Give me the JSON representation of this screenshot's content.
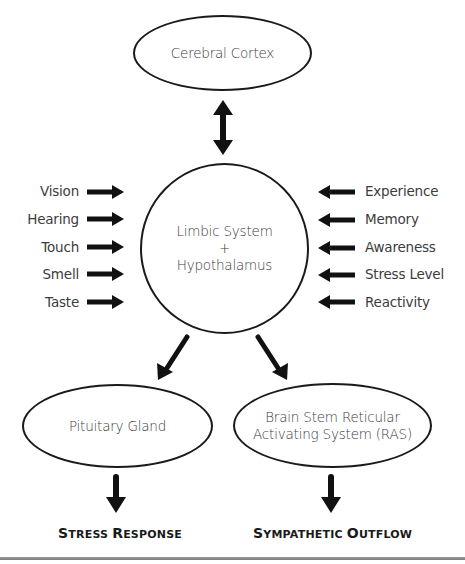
{
  "diagram": {
    "top_node": {
      "label": "Cerebral Cortex"
    },
    "center_node": {
      "lines": [
        "Limbic System",
        "+",
        "Hypothalamus"
      ]
    },
    "left_inputs": [
      {
        "label": "Vision"
      },
      {
        "label": "Hearing"
      },
      {
        "label": "Touch"
      },
      {
        "label": "Smell"
      },
      {
        "label": "Taste"
      }
    ],
    "right_inputs": [
      {
        "label": "Experience"
      },
      {
        "label": "Memory"
      },
      {
        "label": "Awareness"
      },
      {
        "label": "Stress Level"
      },
      {
        "label": "Reactivity"
      }
    ],
    "bottom_left_node": {
      "label": "Pituitary Gland"
    },
    "bottom_right_node": {
      "lines": [
        "Brain Stem Reticular",
        "Activating System (RAS)"
      ]
    },
    "outcomes": {
      "left": {
        "first": "S",
        "rest_1": "TRESS ",
        "second": "R",
        "rest_2": "ESPONSE",
        "full": "Stress Response"
      },
      "right": {
        "first": "S",
        "rest_1": "YMPATHETIC ",
        "second": "O",
        "rest_2": "UTFLOW",
        "full": "Sympathetic Outflow"
      }
    },
    "connections": [
      {
        "from": "Cerebral Cortex",
        "to": "Limbic System + Hypothalamus",
        "type": "bidirectional"
      },
      {
        "from": "Vision",
        "to": "Limbic System + Hypothalamus",
        "type": "directed"
      },
      {
        "from": "Hearing",
        "to": "Limbic System + Hypothalamus",
        "type": "directed"
      },
      {
        "from": "Touch",
        "to": "Limbic System + Hypothalamus",
        "type": "directed"
      },
      {
        "from": "Smell",
        "to": "Limbic System + Hypothalamus",
        "type": "directed"
      },
      {
        "from": "Taste",
        "to": "Limbic System + Hypothalamus",
        "type": "directed"
      },
      {
        "from": "Experience",
        "to": "Limbic System + Hypothalamus",
        "type": "directed"
      },
      {
        "from": "Memory",
        "to": "Limbic System + Hypothalamus",
        "type": "directed"
      },
      {
        "from": "Awareness",
        "to": "Limbic System + Hypothalamus",
        "type": "directed"
      },
      {
        "from": "Stress Level",
        "to": "Limbic System + Hypothalamus",
        "type": "directed"
      },
      {
        "from": "Reactivity",
        "to": "Limbic System + Hypothalamus",
        "type": "directed"
      },
      {
        "from": "Limbic System + Hypothalamus",
        "to": "Pituitary Gland",
        "type": "directed"
      },
      {
        "from": "Limbic System + Hypothalamus",
        "to": "Brain Stem Reticular Activating System (RAS)",
        "type": "directed"
      },
      {
        "from": "Pituitary Gland",
        "to": "Stress Response",
        "type": "directed"
      },
      {
        "from": "Brain Stem Reticular Activating System (RAS)",
        "to": "Sympathetic Outflow",
        "type": "directed"
      }
    ],
    "colors": {
      "stroke": "#1a1a1a",
      "text": "#3c3c3c",
      "background": "#ffffff",
      "footer_rule": "#8a8a8a"
    }
  }
}
